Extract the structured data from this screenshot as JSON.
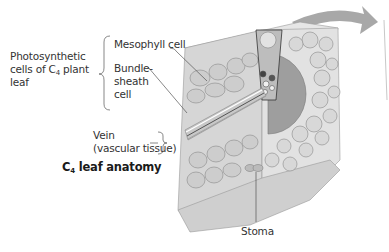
{
  "diagram": {
    "title": {
      "prefix": "C",
      "sub": "4",
      "suffix": " leaf anatomy"
    },
    "group_label": {
      "line1": "Photosynthetic",
      "line2_prefix": "cells of C",
      "line2_sub": "4",
      "line2_suffix": " plant",
      "line3": "leaf"
    },
    "labels": {
      "mesophyll": "Mesophyll cell",
      "bundle_sheath_1": "Bundle-",
      "bundle_sheath_2": "sheath",
      "bundle_sheath_3": "cell",
      "vein_1": "Vein",
      "vein_2": "(vascular tissue)",
      "stoma": "Stoma"
    },
    "colors": {
      "cell_fill": "#d4d4d4",
      "cell_stroke": "#8a8a8a",
      "bundle_sheath": "#9a9a9a",
      "vein": "#c8c8c8",
      "arrow": "#a8a8a8",
      "leader_line": "#555555"
    }
  }
}
